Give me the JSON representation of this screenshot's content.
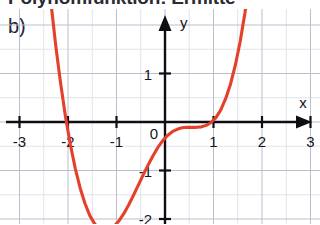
{
  "figure": {
    "caption_cropped": "Polynomfunktion: Ermitte",
    "panel_label": "b)"
  },
  "chart_data": {
    "type": "line",
    "title": "",
    "xlabel": "x",
    "ylabel": "y",
    "xlim": [
      -3.35,
      3.3
    ],
    "ylim": [
      -2.55,
      2.1
    ],
    "grid": true,
    "grid_step": 0.5,
    "legend": "none",
    "axis_arrows": [
      "x",
      "y"
    ],
    "origin_label": "0",
    "x_tick_labels": [
      "-3",
      "-2",
      "-1",
      "1",
      "2",
      "3"
    ],
    "x_ticks": [
      -3,
      -2,
      -1,
      1,
      2,
      3
    ],
    "y_tick_labels": [
      "1",
      "-1",
      "-2"
    ],
    "y_ticks": [
      1,
      -1,
      -2
    ],
    "series": [
      {
        "name": "f",
        "color": "#e5402b",
        "x": [
          -2.35,
          -2.25,
          -2.15,
          -2.05,
          -1.95,
          -1.85,
          -1.75,
          -1.65,
          -1.55,
          -1.45,
          -1.35,
          -1.25,
          -1.15,
          -1.05,
          -0.95,
          -0.85,
          -0.75,
          -0.65,
          -0.55,
          -0.45,
          -0.35,
          -0.25,
          -0.15,
          -0.05,
          0.05,
          0.15,
          0.25,
          0.35,
          0.45,
          0.55,
          0.65,
          0.75,
          0.85,
          0.95,
          1.05,
          1.15,
          1.25,
          1.35,
          1.45,
          1.55,
          1.65,
          1.75,
          1.85,
          1.95,
          2.05,
          2.15,
          2.25
        ],
        "y": [
          2.45,
          1.55,
          0.78,
          0.1,
          -0.47,
          -0.96,
          -1.36,
          -1.68,
          -1.93,
          -2.1,
          -2.2,
          -2.24,
          -2.22,
          -2.15,
          -2.04,
          -1.89,
          -1.71,
          -1.51,
          -1.3,
          -1.09,
          -0.89,
          -0.7,
          -0.53,
          -0.39,
          -0.28,
          -0.2,
          -0.15,
          -0.12,
          -0.11,
          -0.11,
          -0.11,
          -0.1,
          -0.07,
          -0.01,
          0.09,
          0.25,
          0.48,
          0.78,
          1.17,
          1.66,
          2.26,
          2.98,
          3.83,
          4.83,
          5.99,
          7.32,
          8.85
        ]
      }
    ]
  }
}
